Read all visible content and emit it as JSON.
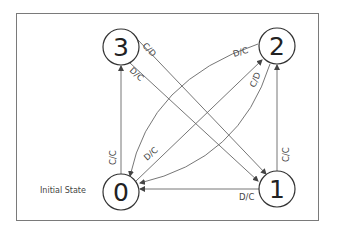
{
  "diagram": {
    "type": "state-transition",
    "initial_label": "Initial State",
    "nodes": [
      {
        "id": "0",
        "label": "0"
      },
      {
        "id": "1",
        "label": "1"
      },
      {
        "id": "2",
        "label": "2"
      },
      {
        "id": "3",
        "label": "3"
      }
    ],
    "edges": [
      {
        "from": "0",
        "to": "3",
        "label": "C/C"
      },
      {
        "from": "1",
        "to": "2",
        "label": "C/C"
      },
      {
        "from": "1",
        "to": "0",
        "label": "D/C"
      },
      {
        "from": "3",
        "to": "1",
        "label": "C/D"
      },
      {
        "from": "3",
        "to": "1",
        "label": "D/C"
      },
      {
        "from": "2",
        "to": "0",
        "label": "D/C"
      },
      {
        "from": "2",
        "to": "0",
        "label": "C/D"
      },
      {
        "from": "0",
        "to": "2",
        "label": "D/C"
      }
    ]
  }
}
